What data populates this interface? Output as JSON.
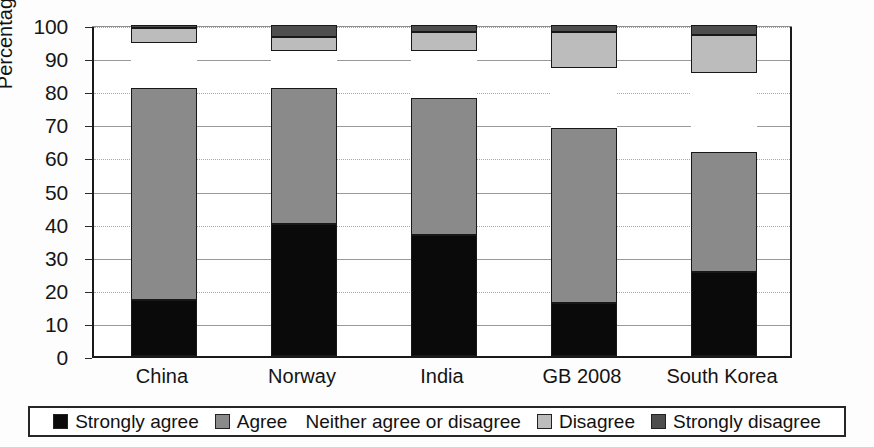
{
  "chart_data": {
    "type": "bar",
    "subtype": "stacked-bar-100",
    "title": "",
    "xlabel": "",
    "ylabel": "Percentage",
    "ylim": [
      0,
      100
    ],
    "yticks": [
      0,
      10,
      20,
      30,
      40,
      50,
      60,
      70,
      80,
      90,
      100
    ],
    "ytick_labels": [
      "0",
      "10",
      "20",
      "30",
      "40",
      "50",
      "60",
      "70",
      "80",
      "90",
      "100"
    ],
    "grid": true,
    "legend_position": "bottom",
    "categories": [
      "China",
      "Norway",
      "India",
      "GB 2008",
      "South Korea"
    ],
    "series": [
      {
        "name": "Strongly agree",
        "color": "#0a0a0a",
        "values": [
          17.0,
          40.0,
          36.5,
          16.0,
          25.5
        ]
      },
      {
        "name": "Agree",
        "color": "#8a8a8a",
        "values": [
          64.0,
          41.0,
          41.5,
          53.0,
          36.0
        ]
      },
      {
        "name": "Neither agree or disagree",
        "color": "#ffffff",
        "values": [
          13.5,
          11.0,
          14.0,
          18.0,
          24.0
        ]
      },
      {
        "name": "Disagree",
        "color": "#bcbcbc",
        "values": [
          4.5,
          4.5,
          6.0,
          11.0,
          11.5
        ]
      },
      {
        "name": "Strongly disagree",
        "color": "#4e4e4e",
        "values": [
          1.0,
          3.5,
          2.0,
          2.0,
          3.0
        ]
      }
    ],
    "cumulative_tops": {
      "China": [
        17.0,
        81.0,
        94.5,
        99.0,
        100.0
      ],
      "Norway": [
        40.0,
        81.0,
        92.0,
        96.5,
        100.0
      ],
      "India": [
        36.5,
        78.0,
        92.0,
        98.0,
        100.0
      ],
      "GB 2008": [
        16.0,
        69.0,
        87.0,
        98.0,
        100.0
      ],
      "South Korea": [
        25.5,
        61.5,
        85.5,
        97.0,
        100.0
      ]
    }
  },
  "legend": {
    "items": [
      {
        "label": "Strongly agree",
        "swatch": "black"
      },
      {
        "label": "Agree",
        "swatch": "mid-gray"
      },
      {
        "label": "Neither agree or disagree",
        "swatch": "white"
      },
      {
        "label": "Disagree",
        "swatch": "light-gray"
      },
      {
        "label": "Strongly disagree",
        "swatch": "dark-gray"
      }
    ]
  },
  "colors": {
    "strongly_agree": "#0a0a0a",
    "agree": "#8a8a8a",
    "neither": "#ffffff",
    "disagree": "#bcbcbc",
    "strongly_disagree": "#4e4e4e",
    "axis": "#1a1a1a",
    "grid": "#9a9a9a",
    "background": "#ffffff"
  }
}
